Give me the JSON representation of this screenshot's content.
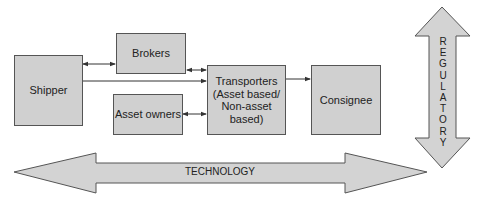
{
  "diagram": {
    "nodes": {
      "shipper": "Shipper",
      "brokers": "Brokers",
      "asset_owners": "Asset owners",
      "transporters": "Transporters\n(Asset based/\nNon-asset\nbased)",
      "consignee": "Consignee"
    },
    "edges": [
      {
        "from": "shipper",
        "to": "brokers",
        "type": "bidirectional"
      },
      {
        "from": "brokers",
        "to": "transporters",
        "type": "bidirectional"
      },
      {
        "from": "shipper",
        "to": "transporters",
        "type": "directed"
      },
      {
        "from": "asset_owners",
        "to": "transporters",
        "type": "bidirectional"
      },
      {
        "from": "transporters",
        "to": "consignee",
        "type": "directed"
      }
    ],
    "arrows": {
      "regulatory": "R\nE\nG\nU\nL\nA\nT\nO\nR\nY",
      "technology": "TECHNOLOGY"
    },
    "colors": {
      "box_fill": "#d0d0d0",
      "box_border": "#555555",
      "arrow_fill": "#d3d3d3",
      "line": "#333333"
    }
  }
}
